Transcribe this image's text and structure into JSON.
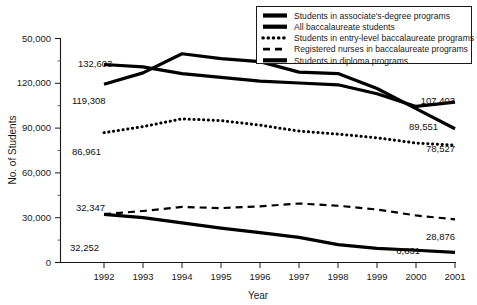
{
  "chart_data": {
    "type": "line",
    "title": "",
    "xlabel": "Year",
    "ylabel": "No. of Students",
    "x": [
      1992,
      1993,
      1994,
      1995,
      1996,
      1997,
      1998,
      1999,
      2000,
      2001
    ],
    "xticklabels": [
      "1992",
      "1993",
      "1994",
      "1995",
      "1996",
      "1997",
      "1998",
      "1999",
      "2000",
      "2001"
    ],
    "yticklabels": [
      "0",
      "30,000",
      "60,000",
      "90,000",
      "120,000",
      "50,000"
    ],
    "ytickvalues": [
      0,
      30000,
      60000,
      90000,
      120000,
      150000
    ],
    "ylim": [
      0,
      150000
    ],
    "xlim": [
      1992,
      2001
    ],
    "grid": false,
    "legend_position": "top-right",
    "minor_ticks": true,
    "series": [
      {
        "name": "Students in associate's-degree programs",
        "style": "solid-thick",
        "values": [
          132603,
          131000,
          126500,
          124000,
          121500,
          120200,
          119000,
          113000,
          104500,
          107403
        ],
        "start_label": "132,603",
        "end_label": "107,403"
      },
      {
        "name": "All baccalaureate students",
        "style": "solid-thick",
        "values": [
          119308,
          127000,
          139800,
          136500,
          134500,
          127500,
          126500,
          116500,
          103000,
          89551
        ],
        "start_label": "119,308",
        "end_label": "89,551"
      },
      {
        "name": "Students in entry-level baccalaureate programs",
        "style": "dotted",
        "values": [
          86961,
          91000,
          96200,
          95000,
          92000,
          88000,
          86000,
          83500,
          80000,
          78527
        ],
        "start_label": "86,961",
        "end_label": "78,527"
      },
      {
        "name": "Registered nurses in baccalaureate programs",
        "style": "dashed",
        "values": [
          32347,
          34500,
          37200,
          36400,
          37600,
          39500,
          38000,
          35500,
          31500,
          28876
        ],
        "start_label": "32,347",
        "end_label": "28,876"
      },
      {
        "name": "Students in diploma programs",
        "style": "solid-thick",
        "values": [
          32252,
          30000,
          26500,
          23000,
          20000,
          16800,
          12000,
          9500,
          8200,
          6831
        ],
        "start_label": "32,252",
        "end_label": "6,831"
      }
    ],
    "annotations": [
      {
        "text": "132,603",
        "series": "Students in associate's-degree programs",
        "position": "left"
      },
      {
        "text": "119,308",
        "series": "All baccalaureate students",
        "position": "left"
      },
      {
        "text": "86,961",
        "series": "Students in entry-level baccalaureate programs",
        "position": "left"
      },
      {
        "text": "32,347",
        "series": "Registered nurses in baccalaureate programs",
        "position": "left"
      },
      {
        "text": "32,252",
        "series": "Students in diploma programs",
        "position": "left"
      },
      {
        "text": "107,403",
        "series": "Students in associate's-degree programs",
        "position": "right"
      },
      {
        "text": "89,551",
        "series": "All baccalaureate students",
        "position": "right"
      },
      {
        "text": "78,527",
        "series": "Students in entry-level baccalaureate programs",
        "position": "right"
      },
      {
        "text": "28,876",
        "series": "Registered nurses in baccalaureate programs",
        "position": "right"
      },
      {
        "text": "6,831",
        "series": "Students in diploma programs",
        "position": "right"
      }
    ],
    "legend": [
      {
        "label": "Students in associate's-degree programs",
        "style": "solid-thick"
      },
      {
        "label": "All baccalaureate students",
        "style": "solid-thick"
      },
      {
        "label": "Students in entry-level baccalaureate programs",
        "style": "dotted"
      },
      {
        "label": "Registered nurses in baccalaureate programs",
        "style": "dashed"
      },
      {
        "label": "Students in diploma programs",
        "style": "solid-thick"
      }
    ],
    "colors": {
      "series": "#000000",
      "axis": "#1a1a1a",
      "background": "#ffffff"
    }
  }
}
